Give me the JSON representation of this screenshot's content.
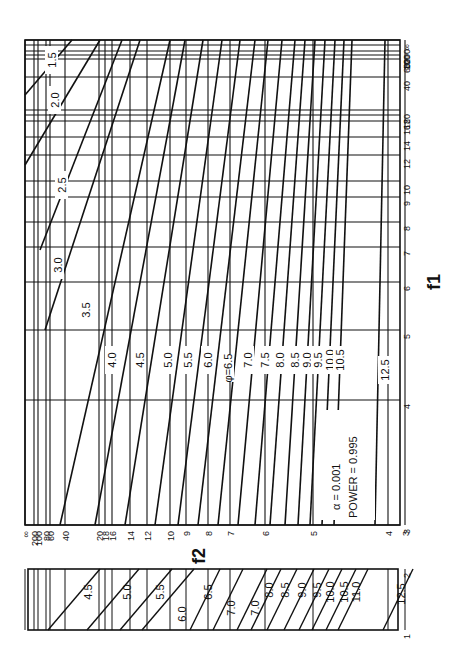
{
  "chart_data": {
    "type": "line",
    "annotation": {
      "alpha": "α = 0.001",
      "power": "POWER = 0.995"
    },
    "xlabel": "f2",
    "ylabel": "f1",
    "phi_label": "φ",
    "f1_ticks": [
      {
        "label": "∞",
        "y": 40
      },
      {
        "label": "200",
        "y": 45
      },
      {
        "label": "100",
        "y": 51
      },
      {
        "label": "80",
        "y": 55
      },
      {
        "label": "60",
        "y": 59
      },
      {
        "label": "40",
        "y": 77
      },
      {
        "label": "20",
        "y": 110
      },
      {
        "label": "18",
        "y": 115
      },
      {
        "label": "16",
        "y": 121
      },
      {
        "label": "14",
        "y": 137
      },
      {
        "label": "12",
        "y": 155
      },
      {
        "label": "10",
        "y": 181
      },
      {
        "label": "9",
        "y": 197
      },
      {
        "label": "8",
        "y": 222
      },
      {
        "label": "7",
        "y": 247
      },
      {
        "label": "6",
        "y": 282
      },
      {
        "label": "5",
        "y": 330
      },
      {
        "label": "4",
        "y": 400
      },
      {
        "label": "3",
        "y": 525
      }
    ],
    "f2_ticks": [
      {
        "label": "∞",
        "x": 25
      },
      {
        "label": "200",
        "x": 34
      },
      {
        "label": "100",
        "x": 38
      },
      {
        "label": "80",
        "x": 46
      },
      {
        "label": "60",
        "x": 50
      },
      {
        "label": "40",
        "x": 65
      },
      {
        "label": "20",
        "x": 99
      },
      {
        "label": "18",
        "x": 105
      },
      {
        "label": "16",
        "x": 112
      },
      {
        "label": "14",
        "x": 130
      },
      {
        "label": "12",
        "x": 147
      },
      {
        "label": "10",
        "x": 170
      },
      {
        "label": "9",
        "x": 186
      },
      {
        "label": "8",
        "x": 208
      },
      {
        "label": "7",
        "x": 230
      },
      {
        "label": "6",
        "x": 265
      },
      {
        "label": "5",
        "x": 313
      },
      {
        "label": "4",
        "x": 388
      },
      {
        "label": "3",
        "x": 405
      }
    ],
    "phi_curves_main": [
      {
        "phi": "1.5",
        "x1": 25,
        "y1": 95,
        "x2": 72,
        "y2": 40,
        "lx": 52,
        "ly": 60
      },
      {
        "phi": "2.0",
        "x1": 25,
        "y1": 165,
        "x2": 100,
        "y2": 40,
        "lx": 55,
        "ly": 100
      },
      {
        "phi": "2.5",
        "x1": 40,
        "y1": 250,
        "x2": 122,
        "y2": 40,
        "lx": 62,
        "ly": 185
      },
      {
        "phi": "3.0",
        "x1": 45,
        "y1": 330,
        "x2": 140,
        "y2": 40,
        "lx": 58,
        "ly": 265
      },
      {
        "phi": "3.5",
        "x1": 60,
        "y1": 525,
        "x2": 170,
        "y2": 40,
        "lx": 86,
        "ly": 310
      },
      {
        "phi": "4.0",
        "x1": 95,
        "y1": 525,
        "x2": 185,
        "y2": 40,
        "lx": 112,
        "ly": 360
      },
      {
        "phi": "4.5",
        "x1": 125,
        "y1": 525,
        "x2": 203,
        "y2": 40,
        "lx": 140,
        "ly": 360
      },
      {
        "phi": "5.0",
        "x1": 155,
        "y1": 525,
        "x2": 222,
        "y2": 40,
        "lx": 168,
        "ly": 360
      },
      {
        "phi": "5.5",
        "x1": 178,
        "y1": 525,
        "x2": 240,
        "y2": 40,
        "lx": 188,
        "ly": 360
      },
      {
        "phi": "6.0",
        "x1": 198,
        "y1": 525,
        "x2": 255,
        "y2": 40,
        "lx": 208,
        "ly": 360
      },
      {
        "phi": "φ=6.5",
        "x1": 218,
        "y1": 525,
        "x2": 268,
        "y2": 40,
        "lx": 228,
        "ly": 368
      },
      {
        "phi": "7.0",
        "x1": 238,
        "y1": 525,
        "x2": 282,
        "y2": 40,
        "lx": 248,
        "ly": 360
      },
      {
        "phi": "7.5",
        "x1": 255,
        "y1": 525,
        "x2": 295,
        "y2": 40,
        "lx": 265,
        "ly": 360
      },
      {
        "phi": "8.0",
        "x1": 270,
        "y1": 525,
        "x2": 305,
        "y2": 40,
        "lx": 280,
        "ly": 360
      },
      {
        "phi": "8.5",
        "x1": 285,
        "y1": 525,
        "x2": 315,
        "y2": 40,
        "lx": 295,
        "ly": 360
      },
      {
        "phi": "9.0",
        "x1": 298,
        "y1": 525,
        "x2": 325,
        "y2": 40,
        "lx": 307,
        "ly": 360
      },
      {
        "phi": "9.5",
        "x1": 310,
        "y1": 525,
        "x2": 335,
        "y2": 40,
        "lx": 318,
        "ly": 360
      },
      {
        "phi": "10.0",
        "x1": 322,
        "y1": 525,
        "x2": 344,
        "y2": 40,
        "lx": 330,
        "ly": 360
      },
      {
        "phi": "10.5",
        "x1": 334,
        "y1": 525,
        "x2": 352,
        "y2": 40,
        "lx": 340,
        "ly": 360
      },
      {
        "phi": "12.5",
        "x1": 375,
        "y1": 525,
        "x2": 385,
        "y2": 40,
        "lx": 385,
        "ly": 370
      }
    ],
    "phi_curves_inset": [
      {
        "phi": "4.5",
        "lx": 88,
        "ly": 592
      },
      {
        "phi": "5.0",
        "lx": 127,
        "ly": 592
      },
      {
        "phi": "5.5",
        "lx": 160,
        "ly": 592
      },
      {
        "phi": "6.0",
        "lx": 182,
        "ly": 614
      },
      {
        "phi": "6.5",
        "lx": 208,
        "ly": 592
      },
      {
        "phi": "7.0",
        "lx": 231,
        "ly": 608
      },
      {
        "phi": "7.0",
        "lx": 255,
        "ly": 608
      },
      {
        "phi": "8.0",
        "lx": 269,
        "ly": 590
      },
      {
        "phi": "8.5",
        "lx": 285,
        "ly": 590
      },
      {
        "phi": "9.0",
        "lx": 302,
        "ly": 590
      },
      {
        "phi": "9.5",
        "lx": 317,
        "ly": 590
      },
      {
        "phi": "10.0",
        "lx": 330,
        "ly": 592
      },
      {
        "phi": "10.5",
        "lx": 344,
        "ly": 592
      },
      {
        "phi": "11.0",
        "lx": 356,
        "ly": 592
      },
      {
        "phi": "12.5",
        "lx": 401,
        "ly": 594
      }
    ],
    "inset_ticks": [
      {
        "label": "2",
        "y": 569
      },
      {
        "label": "1",
        "y": 630
      }
    ]
  }
}
